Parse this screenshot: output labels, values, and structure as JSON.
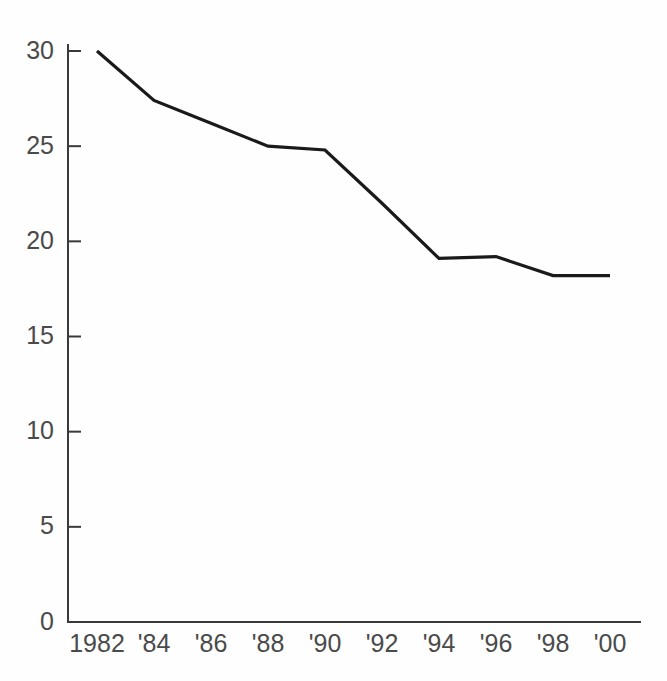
{
  "chart_data": {
    "type": "line",
    "title": "",
    "subtitle": "",
    "xlabel": "",
    "ylabel": "",
    "grid": false,
    "legend": null,
    "legend_position": "none",
    "line_color": "#1a1a1a",
    "axis_color": "#3a3a3a",
    "background_color": "#fefefe",
    "categories": [
      "1982",
      "'84",
      "'86",
      "'88",
      "'90",
      "'92",
      "'94",
      "'96",
      "'98",
      "'00"
    ],
    "x": [
      1982,
      1984,
      1986,
      1988,
      1990,
      1992,
      1994,
      1996,
      1998,
      2000
    ],
    "values": [
      30.0,
      27.4,
      26.2,
      25.0,
      24.8,
      22.0,
      19.1,
      19.2,
      18.2,
      18.2
    ],
    "xlim": [
      1982,
      2000
    ],
    "ylim": [
      0,
      30
    ],
    "yticks": [
      0,
      5,
      10,
      15,
      20,
      25,
      30
    ],
    "ytick_labels": [
      "0",
      "5",
      "10",
      "15",
      "20",
      "25",
      "30"
    ],
    "xtick_labels": [
      "1982",
      "'84",
      "'86",
      "'88",
      "'90",
      "'92",
      "'94",
      "'96",
      "'98",
      "'00"
    ],
    "annotations": []
  }
}
